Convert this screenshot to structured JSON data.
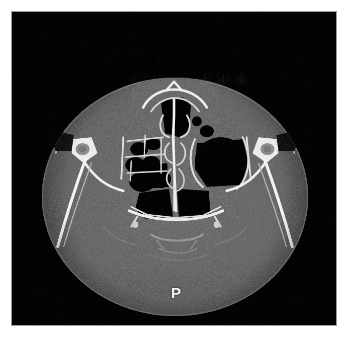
{
  "image": {
    "modality": "CT",
    "plane": "axial",
    "window": "bone",
    "region": "paranasal sinuses",
    "background_color": "#000000",
    "page_background_color": "#ffffff",
    "border_color": "#9a9a9a",
    "viewport": {
      "x": 11,
      "y": 11,
      "width": 326,
      "height": 315
    }
  },
  "overlay": {
    "orientation_marker": {
      "label": "P",
      "meaning": "posterior",
      "color": "#f2f2f2",
      "x": 172,
      "y": 293
    }
  },
  "anatomy": {
    "head_outline": {
      "center_x": 175,
      "center_y": 196,
      "radius_x": 136,
      "radius_y": 122,
      "soft_tissue_color": "#6a6a6a"
    },
    "structures": [
      "nasal septum",
      "ethmoid air cells",
      "maxillary sinus",
      "sphenoid sinus",
      "zygomatic process",
      "lateral orbital wall",
      "nasal turbinates",
      "clivus"
    ],
    "bone_color": "#f0f0f0",
    "air_color": "#050505"
  }
}
